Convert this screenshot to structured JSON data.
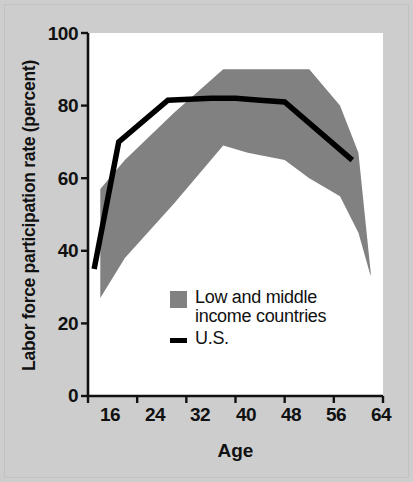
{
  "chart_data": {
    "type": "area",
    "title": "",
    "xlabel": "Age",
    "ylabel": "Labor force participation rate (percent)",
    "xlim": [
      16,
      64
    ],
    "ylim": [
      0,
      100
    ],
    "xticks": [
      16,
      24,
      32,
      40,
      48,
      56,
      64
    ],
    "yticks": [
      0,
      20,
      40,
      60,
      80,
      100
    ],
    "grid": false,
    "legend_position": "inside-lower-center",
    "series": [
      {
        "name": "Low and middle income countries",
        "kind": "band",
        "color": "#818181",
        "x": [
          18,
          22,
          30,
          38,
          42,
          48,
          52,
          57,
          60,
          62
        ],
        "upper": [
          57,
          65,
          78,
          90,
          90,
          90,
          90,
          80,
          67,
          34
        ],
        "lower": [
          27,
          38,
          53,
          69,
          67,
          65,
          60,
          55,
          45,
          33
        ]
      },
      {
        "name": "U.S.",
        "kind": "line",
        "color": "#000000",
        "x": [
          17,
          21,
          29,
          36,
          40,
          44,
          48,
          59
        ],
        "values": [
          35,
          70,
          81.5,
          82,
          82,
          81.5,
          81,
          65
        ]
      }
    ]
  },
  "axes": {
    "y_tick_labels": [
      "100",
      "80",
      "60",
      "40",
      "20",
      "0"
    ],
    "x_tick_labels": [
      "16",
      "24",
      "32",
      "40",
      "48",
      "56",
      "64"
    ],
    "y_title": "Labor force participation rate (percent)",
    "x_title": "Age"
  },
  "legend": {
    "items": [
      {
        "swatch": "band-swatch",
        "line1": "Low and middle",
        "line2": "income countries"
      },
      {
        "swatch": "line-swatch",
        "line1": "U.S.",
        "line2": ""
      }
    ]
  },
  "colors": {
    "band": "#818181",
    "line": "#000000",
    "plot_background": "#ffffff",
    "figure_background": "#cdcdcd",
    "axis": "#111111"
  }
}
